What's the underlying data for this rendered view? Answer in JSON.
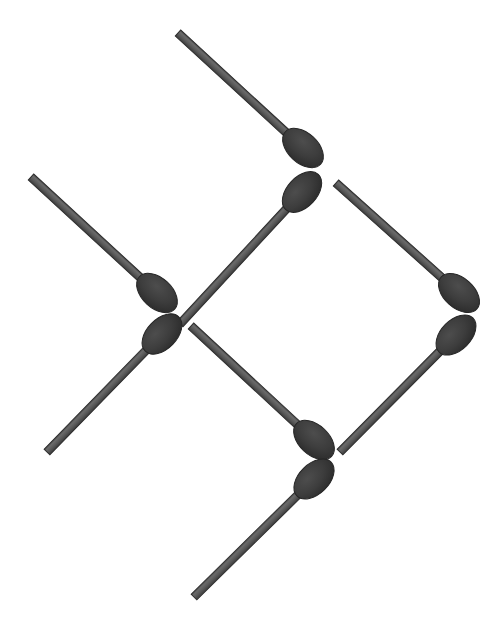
{
  "scene": {
    "title": "Matchstick arrangement",
    "width": 504,
    "height": 633,
    "background_color": "#ffffff",
    "stick_color": "#575757",
    "stick_edge_color": "#2e2e2e",
    "head_color": "#3b3b3b",
    "head_edge_color": "#262626",
    "stick_width": 8,
    "head_rx": 15,
    "head_ry": 24,
    "match_count": 8,
    "description": "Eight matchsticks laid out in a diamond lattice; heads meet in pairs at four junction points while the plain tails radiate outward."
  },
  "matches": [
    {
      "id": "match-top",
      "label": "top match",
      "tail_x": 178,
      "tail_y": 33,
      "head_x": 303,
      "head_y": 148,
      "angle_deg": 42.6,
      "junction": "upper-center"
    },
    {
      "id": "match-upper-center",
      "label": "upper center match",
      "tail_x": 180,
      "tail_y": 324,
      "head_x": 302,
      "head_y": 192,
      "angle_deg": -47.2,
      "junction": "upper-center"
    },
    {
      "id": "match-upper-left",
      "label": "upper left match",
      "tail_x": 31,
      "tail_y": 177,
      "head_x": 157,
      "head_y": 293,
      "angle_deg": 42.6,
      "junction": "left"
    },
    {
      "id": "match-lower-left",
      "label": "lower left match",
      "tail_x": 47,
      "tail_y": 452,
      "head_x": 162,
      "head_y": 334,
      "angle_deg": -45.7,
      "junction": "left"
    },
    {
      "id": "match-upper-right",
      "label": "upper right match",
      "tail_x": 336,
      "tail_y": 183,
      "head_x": 459,
      "head_y": 293,
      "angle_deg": 41.8,
      "junction": "right"
    },
    {
      "id": "match-lower-right",
      "label": "lower right match",
      "tail_x": 340,
      "tail_y": 452,
      "head_x": 456,
      "head_y": 335,
      "angle_deg": -45.2,
      "junction": "right"
    },
    {
      "id": "match-center-lower",
      "label": "center lower match",
      "tail_x": 191,
      "tail_y": 326,
      "head_x": 314,
      "head_y": 440,
      "angle_deg": 42.8,
      "junction": "lower-center"
    },
    {
      "id": "match-bottom",
      "label": "bottom match",
      "tail_x": 194,
      "tail_y": 597,
      "head_x": 314,
      "head_y": 479,
      "angle_deg": -44.5,
      "junction": "lower-center"
    }
  ],
  "junctions": [
    {
      "id": "junction-upper-center",
      "label": "upper center junction",
      "x": 303,
      "y": 170
    },
    {
      "id": "junction-left",
      "label": "left junction",
      "x": 160,
      "y": 314
    },
    {
      "id": "junction-right",
      "label": "right junction",
      "x": 458,
      "y": 314
    },
    {
      "id": "junction-lower-center",
      "label": "lower center junction",
      "x": 314,
      "y": 460
    }
  ]
}
